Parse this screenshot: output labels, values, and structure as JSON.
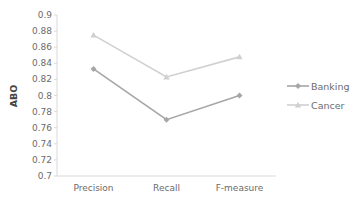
{
  "chart_data": {
    "type": "line",
    "title": "",
    "xlabel": "",
    "ylabel": "ABO",
    "ylim": [
      0.7,
      0.9
    ],
    "yticks": [
      0.7,
      0.72,
      0.74,
      0.76,
      0.78,
      0.8,
      0.82,
      0.84,
      0.86,
      0.88,
      0.9
    ],
    "ytick_labels": [
      "0.7",
      "0.72",
      "0.74",
      "0.76",
      "0.78",
      "0.8",
      "0.82",
      "0.84",
      "0.86",
      "0.88",
      "0.9"
    ],
    "categories": [
      "Precision",
      "Recall",
      "F-measure"
    ],
    "grid": false,
    "legend_position": "right",
    "series": [
      {
        "name": "Banking",
        "values": [
          0.833,
          0.77,
          0.8
        ],
        "color": "#a6a6a6",
        "marker": "diamond"
      },
      {
        "name": "Cancer",
        "values": [
          0.875,
          0.823,
          0.848
        ],
        "color": "#d0d0d0",
        "marker": "triangle"
      }
    ]
  }
}
